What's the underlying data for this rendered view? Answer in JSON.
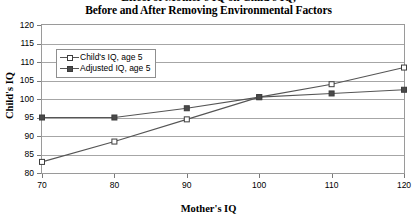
{
  "chart_data": {
    "type": "line",
    "title": "Effect of Mother's IQ on Child's IQ,\nBefore and After Removing Environmental Factors",
    "title_lines": [
      "Effect of Mother's IQ on Child's IQ,",
      "Before and After Removing Environmental Factors"
    ],
    "xlabel": "Mother's IQ",
    "ylabel": "Child's IQ",
    "x": [
      70,
      80,
      90,
      100,
      110,
      120
    ],
    "xlim": [
      70,
      120
    ],
    "ylim": [
      80,
      120
    ],
    "xticks": [
      "70",
      "80",
      "90",
      "100",
      "110",
      "120"
    ],
    "yticks": [
      "80",
      "85",
      "90",
      "95",
      "100",
      "105",
      "110",
      "115",
      "120"
    ],
    "grid": "horizontal",
    "legend_position": "upper-left-inside",
    "series": [
      {
        "name": "Child's IQ, age 5",
        "marker": "open-square",
        "values": [
          83,
          88.5,
          94.5,
          100.5,
          104,
          108.5
        ]
      },
      {
        "name": "Adjusted IQ, age 5",
        "marker": "filled-square",
        "values": [
          95,
          95,
          97.5,
          100.5,
          101.5,
          102.5
        ]
      }
    ],
    "colors": {
      "line": "#555555",
      "marker_fill_open": "#ffffff",
      "marker_fill_solid": "#4a4a4a",
      "marker_edge": "#3d3d3d",
      "gridline": "#a6a6a6",
      "frame": "#9a9a9a",
      "text": "#000000"
    }
  },
  "legend": {
    "items": [
      {
        "label": "Child's IQ, age 5"
      },
      {
        "label": "Adjusted IQ, age 5"
      }
    ]
  }
}
